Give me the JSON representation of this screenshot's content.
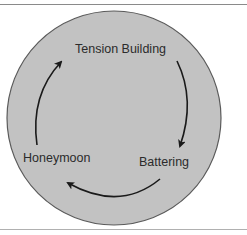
{
  "diagram": {
    "circle_fill": "#c2c2c2",
    "circle_stroke": "#5a5a5a",
    "arrow_color": "#1a1a1a",
    "stages": [
      {
        "label": "Tension Building"
      },
      {
        "label": "Battering"
      },
      {
        "label": "Honeymoon"
      }
    ]
  }
}
